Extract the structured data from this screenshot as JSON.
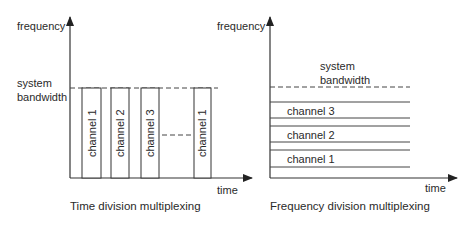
{
  "tdm": {
    "y_axis_label": "frequency",
    "x_axis_label": "time",
    "bandwidth_label_line1": "system",
    "bandwidth_label_line2": "bandwidth",
    "caption": "Time division multiplexing",
    "slots": [
      {
        "label": "channel 1"
      },
      {
        "label": "channel 2"
      },
      {
        "label": "channel 3"
      },
      {
        "label": "channel 1"
      }
    ]
  },
  "fdm": {
    "y_axis_label": "frequency",
    "x_axis_label": "time",
    "bandwidth_label_line1": "system",
    "bandwidth_label_line2": "bandwidth",
    "caption": "Frequency division multiplexing",
    "bands": [
      {
        "label": "channel 3"
      },
      {
        "label": "channel 2"
      },
      {
        "label": "channel 1"
      }
    ]
  }
}
